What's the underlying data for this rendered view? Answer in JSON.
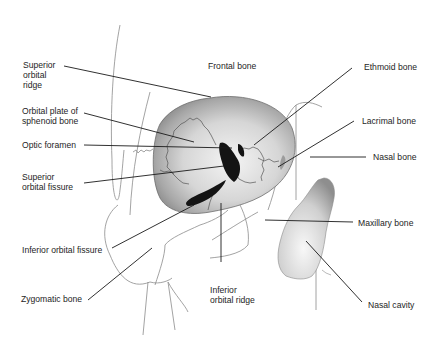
{
  "diagram": {
    "colors": {
      "line": "#1a1a1a",
      "outline": "#9a9a9a",
      "bone_light": "#f2f2f2",
      "bone_dark": "#8a8a8a",
      "fissure": "#151515"
    }
  },
  "labels": {
    "superior_orbital_ridge": "Superior\norbital\nridge",
    "frontal_bone": "Frontal bone",
    "ethmoid_bone": "Ethmoid bone",
    "orbital_plate_sphenoid": "Orbital plate of\nsphenoid bone",
    "lacrimal_bone": "Lacrimal bone",
    "optic_foramen": "Optic foramen",
    "nasal_bone": "Nasal bone",
    "superior_orbital_fissure": "Superior\norbital fissure",
    "maxillary_bone": "Maxillary bone",
    "inferior_orbital_fissure": "Inferior orbital fissure",
    "zygomatic_bone": "Zygomatic bone",
    "inferior_orbital_ridge": "Inferior\norbital ridge",
    "nasal_cavity": "Nasal cavity"
  }
}
